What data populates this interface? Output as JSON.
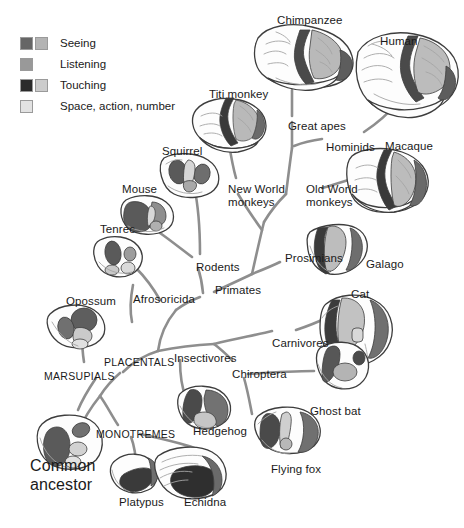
{
  "figure": {
    "type": "phylogenetic-tree",
    "background_color": "#ffffff",
    "branch_color": "#8e8e8e",
    "text_color": "#1a1a1a"
  },
  "legend": {
    "items": [
      {
        "label": "Seeing",
        "swatches": [
          "#666666",
          "#b3b3b3"
        ]
      },
      {
        "label": "Listening",
        "swatches": [
          "#999999"
        ]
      },
      {
        "label": "Touching",
        "swatches": [
          "#2b2b2b",
          "#cccccc"
        ]
      },
      {
        "label": "Space, action, number",
        "swatches": [
          "#e2e2e2"
        ]
      }
    ]
  },
  "palette": {
    "outline": "#3d3d3d",
    "seeing_dark": "#666666",
    "seeing_light": "#b3b3b3",
    "listening": "#999999",
    "touching_dark": "#2b2b2b",
    "touching_light": "#cccccc",
    "space_action_number": "#e2e2e2",
    "fill_white": "#fdfdfd",
    "sulci": "#9d9d9d"
  },
  "species_labels": [
    {
      "id": "chimpanzee",
      "text": "Chimpanzee",
      "x": 277,
      "y": 14
    },
    {
      "id": "human",
      "text": "Human",
      "x": 380,
      "y": 35
    },
    {
      "id": "titi-monkey",
      "text": "Titi monkey",
      "x": 209,
      "y": 88
    },
    {
      "id": "macaque",
      "text": "Macaque",
      "x": 385,
      "y": 140
    },
    {
      "id": "squirrel",
      "text": "Squirrel",
      "x": 162,
      "y": 145
    },
    {
      "id": "mouse",
      "text": "Mouse",
      "x": 122,
      "y": 183
    },
    {
      "id": "tenrec",
      "text": "Tenrec",
      "x": 100,
      "y": 223
    },
    {
      "id": "galago",
      "text": "Galago",
      "x": 366,
      "y": 258
    },
    {
      "id": "cat",
      "text": "Cat",
      "x": 351,
      "y": 288
    },
    {
      "id": "opossum",
      "text": "Opossum",
      "x": 66,
      "y": 295
    },
    {
      "id": "ghost-bat",
      "text": "Ghost bat",
      "x": 310,
      "y": 405
    },
    {
      "id": "hedgehog",
      "text": "Hedgehog",
      "x": 193,
      "y": 425
    },
    {
      "id": "flying-fox",
      "text": "Flying fox",
      "x": 271,
      "y": 463
    },
    {
      "id": "platypus",
      "text": "Platypus",
      "x": 119,
      "y": 496
    },
    {
      "id": "echidna",
      "text": "Echidna",
      "x": 184,
      "y": 496
    }
  ],
  "clade_labels": [
    {
      "id": "great-apes",
      "text": "Great apes",
      "x": 288,
      "y": 120,
      "style": "normal"
    },
    {
      "id": "hominids",
      "text": "Hominids",
      "x": 326,
      "y": 141,
      "style": "normal"
    },
    {
      "id": "new-world-monkeys",
      "line1": "New World",
      "line2": "monkeys",
      "x": 228,
      "y": 183,
      "style": "normal"
    },
    {
      "id": "old-world-monkeys",
      "line1": "Old World",
      "line2": "monkeys",
      "x": 306,
      "y": 183,
      "style": "normal"
    },
    {
      "id": "rodents",
      "text": "Rodents",
      "x": 196,
      "y": 261,
      "style": "normal"
    },
    {
      "id": "prosimians",
      "text": "Prosimians",
      "x": 285,
      "y": 252,
      "style": "normal"
    },
    {
      "id": "primates",
      "text": "Primates",
      "x": 215,
      "y": 284,
      "style": "normal"
    },
    {
      "id": "afrosoricida",
      "text": "Afrosoricida",
      "x": 133,
      "y": 293,
      "style": "normal"
    },
    {
      "id": "carnivores",
      "text": "Carnivores",
      "x": 272,
      "y": 337,
      "style": "normal"
    },
    {
      "id": "insectivores",
      "text": "Insectivores",
      "x": 174,
      "y": 352,
      "style": "normal"
    },
    {
      "id": "chiroptera",
      "text": "Chiroptera",
      "x": 232,
      "y": 368,
      "style": "normal"
    },
    {
      "id": "placentals",
      "text": "PLACENTALS",
      "x": 104,
      "y": 357,
      "style": "caps"
    },
    {
      "id": "marsupials",
      "text": "MARSUPIALS",
      "x": 44,
      "y": 371,
      "style": "caps"
    },
    {
      "id": "monotremes",
      "text": "MONOTREMES",
      "x": 96,
      "y": 429,
      "style": "caps"
    }
  ],
  "root_label": {
    "id": "common-ancestor",
    "line1": "Common",
    "line2": "ancestor",
    "x": 30,
    "y": 457
  }
}
